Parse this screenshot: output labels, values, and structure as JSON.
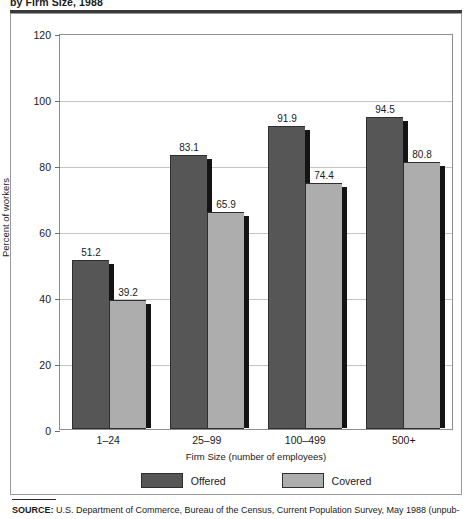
{
  "figure": {
    "title": "by Firm Size, 1988",
    "source_prefix": "SOURCE:",
    "source_text": "U.S. Department of Commerce, Bureau of the Census, Current Population Survey, May 1988 (unpub-"
  },
  "chart_data": {
    "type": "bar",
    "title": "by Firm Size, 1988",
    "xlabel": "Firm Size (number of employees)",
    "ylabel": "Percent of workers",
    "categories": [
      "1–24",
      "25–99",
      "100–499",
      "500+"
    ],
    "series": [
      {
        "name": "Offered",
        "color": "#565656",
        "values": [
          51.2,
          83.1,
          91.9,
          94.5
        ]
      },
      {
        "name": "Covered",
        "color": "#adadad",
        "values": [
          39.2,
          65.9,
          74.4,
          80.8
        ]
      }
    ],
    "ylim": [
      0,
      120
    ],
    "yticks": [
      0,
      20,
      40,
      60,
      80,
      100,
      120
    ],
    "ytick_labels": [
      "0",
      "20",
      "40",
      "60",
      "80",
      "100",
      "120"
    ],
    "grid": "horizontal",
    "legend_position": "bottom"
  }
}
